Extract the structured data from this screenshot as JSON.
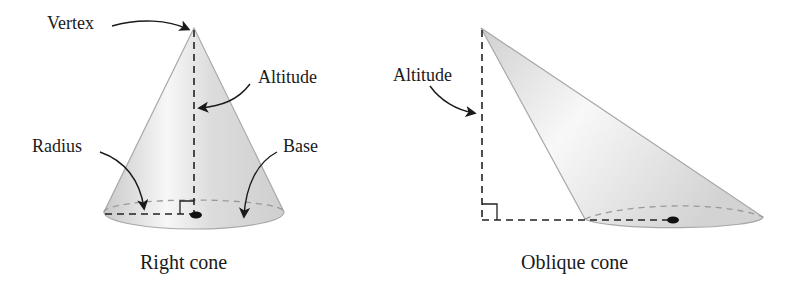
{
  "right_cone": {
    "caption": "Right cone",
    "labels": {
      "vertex": "Vertex",
      "altitude": "Altitude",
      "radius": "Radius",
      "base": "Base"
    }
  },
  "oblique_cone": {
    "caption": "Oblique cone",
    "labels": {
      "altitude": "Altitude"
    }
  },
  "colors": {
    "cone_fill": "#d9d9d9",
    "cone_edge": "#a8a8a8",
    "dashed_line": "#222222",
    "hidden_edge": "#9a9a9a",
    "arrow": "#1a1a1a"
  }
}
